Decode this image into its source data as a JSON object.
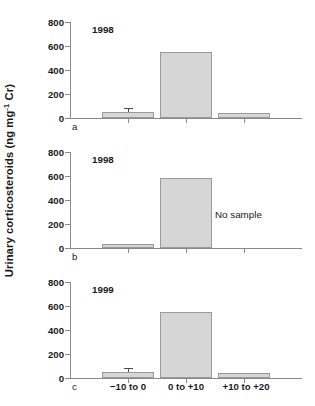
{
  "chart_data": {
    "type": "bar",
    "title": "",
    "xlabel": "",
    "ylabel": "Urinary corticosteroids (ng mg",
    "ylabel_sup": "-1",
    "ylabel_tail": " Cr)",
    "ylim": [
      0,
      800
    ],
    "yticks": [
      0,
      200,
      400,
      600,
      800
    ],
    "ytick_labels": [
      "0",
      "200",
      "400",
      "600",
      "800"
    ],
    "grid": false,
    "legend": "none",
    "categories": [
      "−10 to 0",
      "0 to +10",
      "+10 to +20"
    ],
    "panels": [
      {
        "letter": "a",
        "year": "1998",
        "values": [
          50,
          548,
          42
        ],
        "errors": [
          28,
          null,
          null
        ],
        "no_sample_label": "",
        "no_sample_category_index": null
      },
      {
        "letter": "b",
        "year": "1998",
        "values": [
          35,
          582,
          null
        ],
        "errors": [
          null,
          null,
          null
        ],
        "no_sample_label": "No sample",
        "no_sample_category_index": 2
      },
      {
        "letter": "c",
        "year": "1999",
        "values": [
          52,
          548,
          44
        ],
        "errors": [
          26,
          null,
          null
        ],
        "no_sample_label": "",
        "no_sample_category_index": null
      }
    ]
  },
  "colors": {
    "bar_fill": "#d6d6d6",
    "bar_edge": "#9a9a9a",
    "axis": "#8a8a8a",
    "error": "#4a4a4a",
    "text": "#1a1a1a",
    "background": "#ffffff"
  }
}
